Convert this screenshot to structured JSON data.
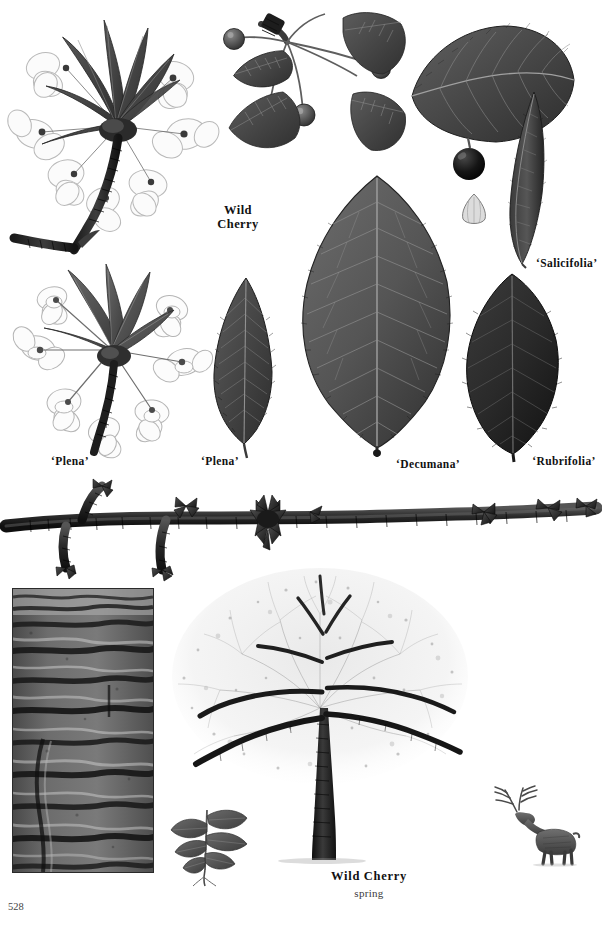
{
  "page": {
    "number": "528",
    "subject": "Wild Cherry",
    "background_color": "#ffffff",
    "ink_color": "#111111"
  },
  "labels": {
    "wild_cherry_top": "Wild\nCherry",
    "salicifolia": "‘Salicifolia’",
    "plena_flower": "‘Plena’",
    "plena_leaf": "‘Plena’",
    "decumana": "‘Decumana’",
    "rubrifolia": "‘Rubrifolia’"
  },
  "caption": {
    "title": "Wild Cherry",
    "season": "spring"
  },
  "figures": {
    "flowering_branch_species": {
      "name": "flowering-branch-wild-cherry",
      "description": "Flowering shoot with dark lance-shaped leaves and white single blossoms on a dark woody stem"
    },
    "fruiting_cluster": {
      "name": "fruiting-cluster",
      "description": "Cherry fruits on long pedicels radiating from a bud node with serrated leaves"
    },
    "ripe_cherry": {
      "name": "ripe-cherry-fruit",
      "description": "Single dark ripe cherry on a stalk"
    },
    "cherry_stone": {
      "name": "cherry-stone",
      "description": "Pale teardrop-shaped cherry stone"
    },
    "leaf_salicifolia": {
      "name": "leaf-salicifolia",
      "description": "Very narrow willow-like leaf"
    },
    "flowering_branch_plena": {
      "name": "flowering-branch-plena",
      "description": "Double-flowered Plena shoot with layered white petals"
    },
    "leaf_plena": {
      "name": "leaf-plena",
      "description": "Narrow elliptic leaf with coarse serrate margin"
    },
    "leaf_decumana": {
      "name": "leaf-decumana",
      "description": "Very large broad obovate leaf with pinnate venation"
    },
    "leaf_rubrifolia": {
      "name": "leaf-rubrifolia",
      "description": "Dark purple-toned ovate leaf"
    },
    "winter_twig": {
      "name": "winter-twig",
      "description": "Horizontal winter twig with bud clusters and side shoots spanning the page"
    },
    "bark_photograph": {
      "name": "bark-photograph",
      "description": "Close-up of cherry bark with horizontal lenticel banding"
    },
    "tree_habit": {
      "name": "tree-habit-spring",
      "description": "Whole tree in full spring blossom with dark trunk and spreading branches"
    },
    "seedling": {
      "name": "seedling",
      "description": "Young seedling with paired leaves and root"
    },
    "deer_scale": {
      "name": "deer-scale-figure",
      "description": "Stag with branching antlers shown for scale"
    }
  }
}
